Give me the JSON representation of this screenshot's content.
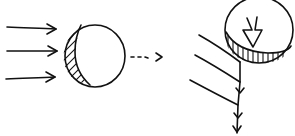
{
  "diagram": {
    "colors": {
      "ink": "#111111",
      "background": "#ffffff"
    },
    "left_panel": {
      "incoming_arrows": 3,
      "sphere": "circle with hatched left crescent"
    },
    "transition": {
      "type": "dotted-arrow"
    },
    "right_panel": {
      "slanted_lines": 3,
      "sphere": "circle with hatched bottom band and inner down arrow",
      "vertical_line_arrowheads": 3
    }
  }
}
